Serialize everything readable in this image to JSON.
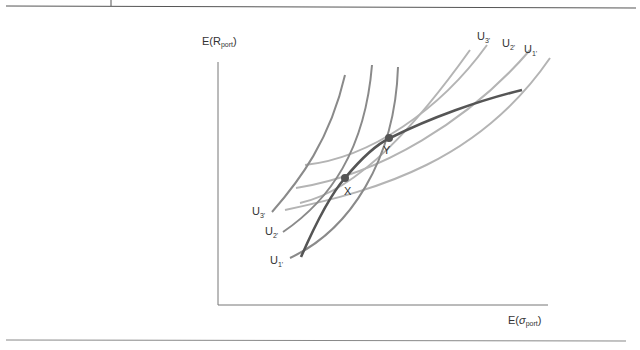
{
  "figure": {
    "y_axis_label": {
      "main": "E(R",
      "sub": "port",
      "close": ")"
    },
    "x_axis_label": {
      "main": "E(",
      "sigma": "σ",
      "sub": "port",
      "close": ")"
    },
    "points": [
      {
        "id": "X",
        "label": "X"
      },
      {
        "id": "Y",
        "label": "Y"
      }
    ],
    "steep_curve_labels": [
      {
        "base": "U",
        "sub": "3'"
      },
      {
        "base": "U",
        "sub": "2'"
      },
      {
        "base": "U",
        "sub": "1'"
      }
    ],
    "flat_curve_labels": [
      {
        "base": "U",
        "sub": "3'"
      },
      {
        "base": "U",
        "sub": "2'"
      },
      {
        "base": "U",
        "sub": "1'"
      }
    ],
    "colors": {
      "frontier": "#555555",
      "steep_curves": "#8a8a8a",
      "flat_curves": "#b4b4b4",
      "axes": "#777777",
      "points": "#555555"
    }
  }
}
